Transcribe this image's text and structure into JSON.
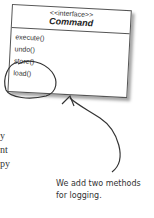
{
  "diagram": {
    "interface": {
      "stereotype": "<<interface>>",
      "name": "Command",
      "methods": [
        "execute()",
        "undo()",
        "store()",
        "load()"
      ]
    },
    "annotation": {
      "line1": "We add two methods",
      "line2": "for logging."
    },
    "body_fragments": [
      "y",
      "nt",
      "py"
    ]
  }
}
